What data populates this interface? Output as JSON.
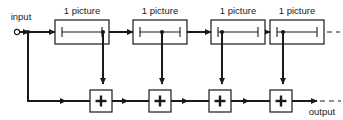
{
  "diagram": {
    "type": "signal-flow-block-diagram",
    "canvas": {
      "width": 343,
      "height": 120,
      "background": "#ffffff"
    },
    "line_color": "#1a1a1a",
    "io": {
      "input_label": "input",
      "output_label": "output"
    },
    "delay_blocks": [
      {
        "id": "delay-1",
        "label": "1 picture",
        "x": 55,
        "y": 20,
        "w": 54,
        "h": 24,
        "label_x": 82,
        "label_y": 13
      },
      {
        "id": "delay-2",
        "label": "1 picture",
        "x": 133,
        "y": 20,
        "w": 54,
        "h": 24,
        "label_x": 160,
        "label_y": 13
      },
      {
        "id": "delay-3",
        "label": "1 picture",
        "x": 211,
        "y": 20,
        "w": 54,
        "h": 24,
        "label_x": 238,
        "label_y": 13
      },
      {
        "id": "delay-4",
        "label": "1 picture",
        "x": 270,
        "y": 20,
        "w": 54,
        "h": 24,
        "label_x": 297,
        "label_y": 13
      }
    ],
    "adders": [
      {
        "id": "adder-1",
        "symbol": "+",
        "cx": 101,
        "cy": 101,
        "size": 22
      },
      {
        "id": "adder-2",
        "symbol": "+",
        "cx": 160,
        "cy": 101,
        "size": 22
      },
      {
        "id": "adder-3",
        "symbol": "+",
        "cx": 220,
        "cy": 101,
        "size": 22
      },
      {
        "id": "adder-4",
        "symbol": "+",
        "cx": 281,
        "cy": 101,
        "size": 22
      }
    ],
    "branch_nodes": [
      {
        "id": "node-input",
        "cx": 28,
        "cy": 32
      },
      {
        "id": "node-tap-1",
        "cx": 103,
        "cy": 32
      },
      {
        "id": "node-tap-2",
        "cx": 162,
        "cy": 32
      },
      {
        "id": "node-tap-3",
        "cx": 222,
        "cy": 32
      },
      {
        "id": "node-tap-4",
        "cx": 283,
        "cy": 32
      }
    ],
    "continuation": {
      "top_dashes": "dashed line continuing to the right",
      "bottom_dashes": "dashed line continuing to the right"
    },
    "annotations": {
      "delay_glyph": "horizontal line with vertical end bars (delay element)",
      "adder_glyph": "plus sign inside square (summing junction)"
    }
  }
}
